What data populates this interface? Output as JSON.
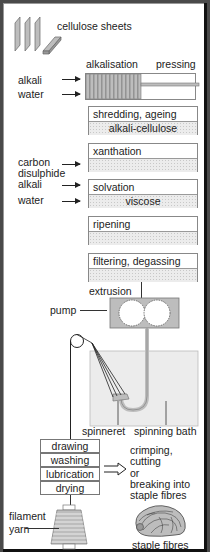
{
  "diagram": {
    "inputs": {
      "cellulose_sheets": "cellulose sheets",
      "alkali_1": "alkali",
      "water_1": "water",
      "carbon": "carbon",
      "disulphide": "disulphide",
      "alkali_2": "alkali",
      "water_2": "water"
    },
    "stages": {
      "alkalisation": "alkalisation",
      "pressing": "pressing",
      "shredding": "shredding, ageing",
      "alkali_cellulose": "alkali-cellulose",
      "xanthation": "xanthation",
      "solvation": "solvation",
      "viscose": "viscose",
      "ripening": "ripening",
      "filtering": "filtering, degassing",
      "extrusion": "extrusion",
      "pump": "pump",
      "spinneret": "spinneret",
      "spinning_bath": "spinning bath"
    },
    "finishing": [
      "drawing",
      "washing",
      "lubrication",
      "drying"
    ],
    "staple_branch": {
      "line1": "crimping,",
      "line2": "cutting",
      "line3": "or",
      "line4": "breaking into",
      "line5": "staple fibres"
    },
    "outputs": {
      "filament": "filament",
      "yarn": "yarn",
      "staple_fibres": "staple fibres"
    },
    "colors": {
      "background": "#ffffff",
      "frame": "#4a4a4a",
      "fill_grey": "#bdbdbd",
      "dotted_fill": "#ececec",
      "line": "#222222"
    }
  }
}
